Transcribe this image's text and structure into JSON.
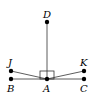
{
  "diagram": {
    "points": [
      {
        "id": "D",
        "label": "D",
        "x": 47,
        "y": 22
      },
      {
        "id": "A",
        "label": "A",
        "x": 47,
        "y": 79
      },
      {
        "id": "B",
        "label": "B",
        "x": 11,
        "y": 79
      },
      {
        "id": "C",
        "label": "C",
        "x": 84,
        "y": 79
      },
      {
        "id": "J",
        "label": "J",
        "x": 11,
        "y": 71
      },
      {
        "id": "K",
        "label": "K",
        "x": 84,
        "y": 71
      }
    ],
    "segments": [
      [
        "A",
        "D"
      ],
      [
        "B",
        "C"
      ],
      [
        "A",
        "J"
      ],
      [
        "A",
        "K"
      ]
    ],
    "right_angle_at": "A"
  }
}
